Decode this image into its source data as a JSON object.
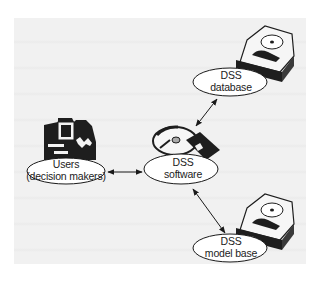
{
  "diagram": {
    "type": "architecture",
    "nodes": [
      {
        "id": "users",
        "line1": "Users",
        "line2": "(decision makers)",
        "icon": "workstation-icon"
      },
      {
        "id": "software",
        "line1": "DSS",
        "line2": "software",
        "icon": "disk-and-floppy-icon"
      },
      {
        "id": "database",
        "line1": "DSS",
        "line2": "database",
        "icon": "hard-drive-icon"
      },
      {
        "id": "modelbase",
        "line1": "DSS",
        "line2": "model base",
        "icon": "hard-drive-icon"
      }
    ],
    "edges": [
      {
        "from": "users",
        "to": "software",
        "direction": "bidirectional"
      },
      {
        "from": "software",
        "to": "database",
        "direction": "bidirectional"
      },
      {
        "from": "software",
        "to": "modelbase",
        "direction": "bidirectional"
      }
    ],
    "colors": {
      "background_panel": "#f1f1f1",
      "stroke": "#1a1a1a",
      "ellipse_fill": "#ffffff"
    }
  }
}
